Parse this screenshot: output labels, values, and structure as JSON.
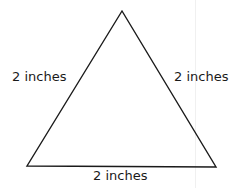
{
  "diagram": {
    "shape": "equilateral-triangle",
    "stroke_color": "#1a1a1a",
    "sides": [
      {
        "position": "left",
        "label": "2 inches"
      },
      {
        "position": "right",
        "label": "2 inches"
      },
      {
        "position": "bottom",
        "label": "2 inches"
      }
    ]
  }
}
